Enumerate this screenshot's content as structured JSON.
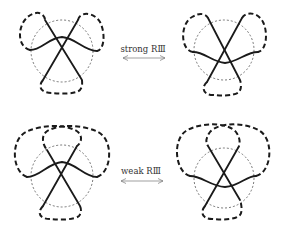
{
  "figure": {
    "transitions": [
      {
        "label": "strong RⅢ",
        "arrow": "bidirectional"
      },
      {
        "label": "weak RⅢ",
        "arrow": "bidirectional"
      }
    ],
    "diagrams": [
      {
        "id": "strong-before",
        "description": "three strands in dotted circle, wavy strand above crossing, three short dashed loops"
      },
      {
        "id": "strong-after",
        "description": "three strands in dotted circle, wavy strand below crossing, three short dashed loops"
      },
      {
        "id": "weak-before",
        "description": "three strands in dotted circle, wavy strand above crossing, two large crossing dashed loops on top and one bottom loop"
      },
      {
        "id": "weak-after",
        "description": "three strands in dotted circle, wavy strand below crossing, two large crossing dashed loops on top and one bottom loop"
      }
    ],
    "colors": {
      "strand": "#1a1a1a",
      "circle": "#555555",
      "arrow": "#777777"
    }
  }
}
